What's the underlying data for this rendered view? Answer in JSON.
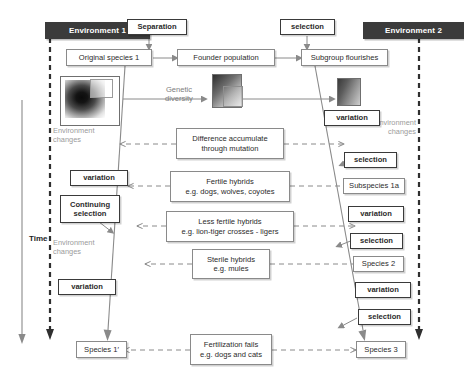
{
  "diagram": {
    "title_present": false,
    "time_axis": {
      "label": "Time",
      "direction": "downward"
    },
    "environments": [
      {
        "id": "env1",
        "label": "Environment 1"
      },
      {
        "id": "env2",
        "label": "Environment 2"
      }
    ],
    "environment_change_notes": [
      {
        "id": "env-changes-left-top",
        "text": "Environment\nchanges"
      },
      {
        "id": "env-changes-left-mid",
        "text": "Environment\nchanges"
      },
      {
        "id": "env-changes-right-top",
        "text": "Environment\nchanges"
      }
    ],
    "top_flow": [
      {
        "id": "original-species-1",
        "label": "Original species 1"
      },
      {
        "id": "founder-population",
        "label": "Founder population"
      },
      {
        "id": "subgroup-flourishes",
        "label": "Subgroup flourishes"
      }
    ],
    "top_drivers": [
      {
        "id": "separation",
        "label": "Separation"
      },
      {
        "id": "selection-top",
        "label": "selection"
      }
    ],
    "genetic_diversity_label": "Genetic\ndiversity",
    "population_tiles": [
      {
        "id": "tile-original-population",
        "kind": "radial-blob"
      },
      {
        "id": "tile-founder-population",
        "kind": "gradient-square"
      },
      {
        "id": "tile-subgroup-population",
        "kind": "gradient-square"
      }
    ],
    "center_stages": [
      {
        "id": "difference-accumulate",
        "label": "Difference accumulate\nthrough mutation"
      },
      {
        "id": "fertile-hybrids",
        "label": "Fertile hybrids\ne.g. dogs, wolves, coyotes"
      },
      {
        "id": "less-fertile-hybrids",
        "label": "Less fertile hybrids\ne.g. lion-tiger crosses - ligers"
      },
      {
        "id": "sterile-hybrids",
        "label": "Sterile hybrids\ne.g. mules"
      },
      {
        "id": "fertilization-fails",
        "label": "Fertilization fails\ne.g. dogs and cats"
      }
    ],
    "left_branch": [
      {
        "id": "variation-left-1",
        "label": "variation",
        "emphasis": "bold"
      },
      {
        "id": "continuing-selection",
        "label": "Continuing\nselection",
        "emphasis": "bold"
      },
      {
        "id": "variation-left-2",
        "label": "variation",
        "emphasis": "bold"
      },
      {
        "id": "species-1-prime",
        "label": "Species 1′",
        "emphasis": "normal"
      }
    ],
    "right_branch": [
      {
        "id": "variation-right-1",
        "label": "variation",
        "emphasis": "bold"
      },
      {
        "id": "selection-right-1",
        "label": "selection",
        "emphasis": "bold"
      },
      {
        "id": "subspecies-1a",
        "label": "Subspecies 1a",
        "emphasis": "normal"
      },
      {
        "id": "variation-right-2",
        "label": "variation",
        "emphasis": "bold"
      },
      {
        "id": "selection-right-2",
        "label": "selection",
        "emphasis": "bold"
      },
      {
        "id": "species-2",
        "label": "Species 2",
        "emphasis": "normal"
      },
      {
        "id": "variation-right-3",
        "label": "variation",
        "emphasis": "bold"
      },
      {
        "id": "selection-right-3",
        "label": "selection",
        "emphasis": "bold"
      },
      {
        "id": "species-3",
        "label": "Species 3",
        "emphasis": "normal"
      }
    ],
    "colors": {
      "environment_band": "#3b3b3b",
      "environment_text": "#ffffff",
      "box_border": "#8a8a8a",
      "emphasis_border": "#3a3a3a",
      "connector": "#8a8a8a",
      "ghost_text": "#9b9b9b",
      "body_text": "#2b2b2b",
      "background": "#ffffff"
    }
  }
}
